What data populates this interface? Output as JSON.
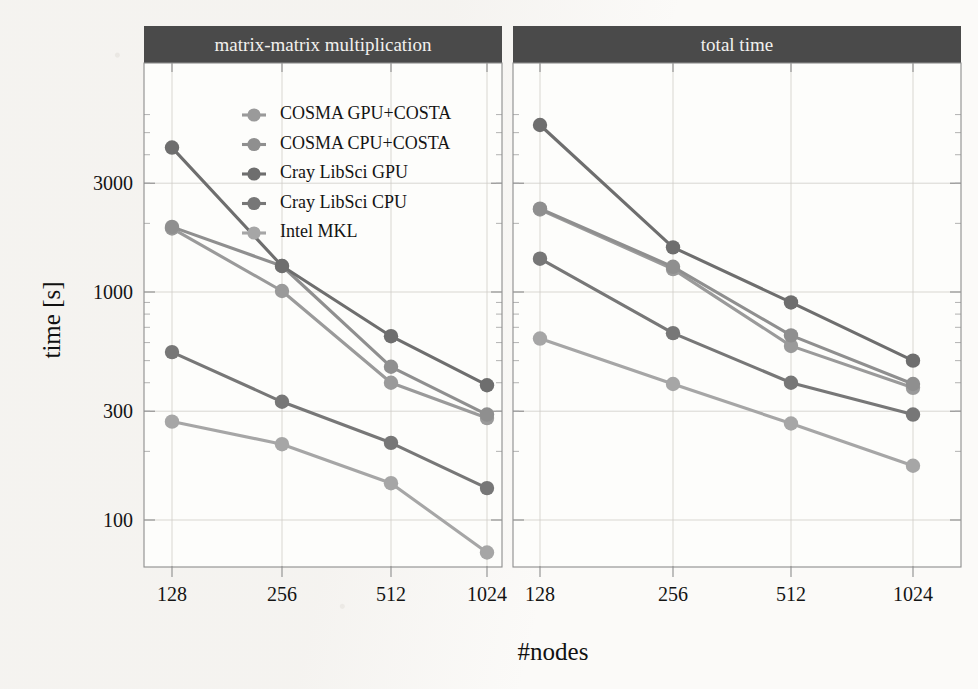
{
  "figure": {
    "ylabel": "time [s]",
    "xlabel": "#nodes",
    "panels": [
      {
        "title": "matrix-matrix multiplication"
      },
      {
        "title": "total time"
      }
    ],
    "y_ticks": [
      {
        "label": "3000",
        "value": 3000
      },
      {
        "label": "1000",
        "value": 1000
      },
      {
        "label": "300",
        "value": 300
      },
      {
        "label": "100",
        "value": 100
      }
    ],
    "x_ticks": [
      "128",
      "256",
      "512",
      "1024"
    ]
  },
  "colors": {
    "strip_background": "#4a4a4a",
    "strip_text": "#f2f1ee",
    "panel_background": "#fdfdfb",
    "axis": "#8d8d8d",
    "grid": "#cfcdc8",
    "series_cosma_gpu_costa": "#9a9a9a",
    "series_cosma_cpu_costa": "#8f8f8f",
    "series_cray_gpu": "#6e6e6e",
    "series_cray_cpu": "#777777",
    "series_intel_mkl": "#a6a6a6"
  },
  "chart_data": {
    "type": "line",
    "title": "",
    "xlabel": "#nodes",
    "ylabel": "time [s]",
    "yscale": "log",
    "ylim": [
      60,
      7000
    ],
    "xscale": "log2",
    "x": [
      128,
      256,
      512,
      1024
    ],
    "grid": true,
    "legend_position": "top-left inside panel 1",
    "panels": [
      {
        "name": "matrix-matrix multiplication",
        "series": [
          {
            "name": "COSMA GPU+COSTA",
            "values": [
              1900,
              1010,
              400,
              280
            ]
          },
          {
            "name": "COSMA CPU+COSTA",
            "values": [
              1930,
              1300,
              470,
              290
            ]
          },
          {
            "name": "Cray LibSci GPU",
            "values": [
              4300,
              1300,
              640,
              390
            ]
          },
          {
            "name": "Cray LibSci CPU",
            "values": [
              545,
              330,
              218,
              138
            ]
          },
          {
            "name": "Intel MKL",
            "values": [
              270,
              215,
              145,
              72
            ]
          }
        ]
      },
      {
        "name": "total time",
        "series": [
          {
            "name": "COSMA GPU+COSTA",
            "values": [
              2300,
              1260,
              580,
              380
            ]
          },
          {
            "name": "COSMA CPU+COSTA",
            "values": [
              2320,
              1290,
              645,
              395
            ]
          },
          {
            "name": "Cray LibSci GPU",
            "values": [
              5400,
              1570,
              900,
              500
            ]
          },
          {
            "name": "Cray LibSci CPU",
            "values": [
              1400,
              660,
              400,
              290
            ]
          },
          {
            "name": "Intel MKL",
            "values": [
              625,
              395,
              265,
              173
            ]
          }
        ]
      }
    ],
    "legend": [
      "COSMA GPU+COSTA",
      "COSMA CPU+COSTA",
      "Cray LibSci GPU",
      "Cray LibSci CPU",
      "Intel MKL"
    ]
  }
}
